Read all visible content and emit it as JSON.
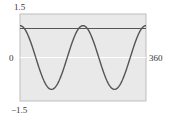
{
  "chart_data": {
    "type": "line",
    "title": "",
    "xlabel": "",
    "ylabel": "",
    "xlim": [
      0,
      360
    ],
    "ylim": [
      -1.5,
      1.5
    ],
    "grid": false,
    "tick_labels": {
      "y_top": "1.5",
      "y_bottom": "−1.5",
      "x_left": "0",
      "x_right": "360"
    },
    "series": [
      {
        "name": "curve",
        "function": "1.1*cos(2x)",
        "x": [
          0,
          22.5,
          45,
          67.5,
          90,
          112.5,
          135,
          157.5,
          180,
          202.5,
          225,
          247.5,
          270,
          292.5,
          315,
          337.5,
          360
        ],
        "y": [
          1.1,
          0.78,
          0,
          -0.78,
          -1.1,
          -0.78,
          0,
          0.78,
          1.1,
          0.78,
          0,
          -0.78,
          -1.1,
          -0.78,
          0,
          0.78,
          1.1
        ],
        "color": "#555555"
      },
      {
        "name": "horizontal-line",
        "function": "y = 1",
        "x": [
          0,
          360
        ],
        "y": [
          1,
          1
        ],
        "color": "#555555"
      }
    ],
    "colors": {
      "plot_background": "#e9e9e9",
      "frame": "#bdbdbd",
      "axis": "#ffffff"
    }
  }
}
